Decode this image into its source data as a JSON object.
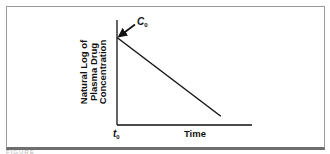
{
  "chart_data": {
    "type": "line",
    "title": "",
    "xlabel": "Time",
    "ylabel_lines": [
      "Natural Log of",
      "Plasma Drug",
      "Concentration"
    ],
    "x_tick_labels": [
      {
        "x": 0,
        "label": "t",
        "sub": "0"
      }
    ],
    "annotations": [
      {
        "label": "C",
        "sub": "0",
        "points_to": {
          "x": 0,
          "y": 1.0
        },
        "arrow": true
      }
    ],
    "xlim": [
      0,
      1.3
    ],
    "ylim": [
      0,
      1.2
    ],
    "series": [
      {
        "name": "ln Cp",
        "x": [
          0,
          1.0
        ],
        "y": [
          1.0,
          0.1
        ]
      }
    ],
    "grid": false,
    "legend": "none"
  },
  "caption": "FIGURE"
}
